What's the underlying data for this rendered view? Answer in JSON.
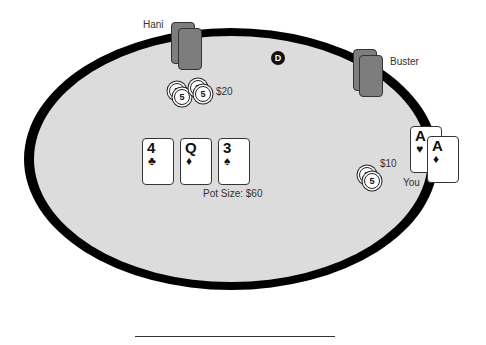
{
  "players": {
    "hani": {
      "name": "Hani",
      "bet": "$20"
    },
    "buster": {
      "name": "Buster"
    },
    "you": {
      "name": "You",
      "bet": "$10",
      "cards": [
        {
          "rank": "A",
          "suit": "♥"
        },
        {
          "rank": "A",
          "suit": "♦"
        }
      ]
    }
  },
  "board": {
    "cards": [
      {
        "rank": "4",
        "suit": "♣"
      },
      {
        "rank": "Q",
        "suit": "♦"
      },
      {
        "rank": "3",
        "suit": "♠"
      }
    ]
  },
  "pot": {
    "label": "Pot Size: $60"
  },
  "dealer_button": "D",
  "chip_value": "5"
}
